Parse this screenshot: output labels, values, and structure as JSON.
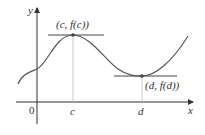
{
  "diagram": {
    "axes": {
      "x_label": "x",
      "y_label": "y",
      "origin_label": "0"
    },
    "ticks": {
      "c": "c",
      "d": "d"
    },
    "points": {
      "max": {
        "label": "(c, f(c))"
      },
      "min": {
        "label": "(d, f(d))"
      }
    },
    "colors": {
      "curve": "#555555",
      "axis": "#333333",
      "guide": "#bbbbbb"
    }
  }
}
